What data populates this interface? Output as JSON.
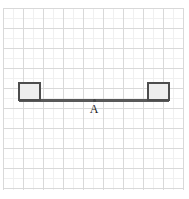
{
  "figure": {
    "width": 189,
    "height": 199,
    "background_color": "#ffffff"
  },
  "grid": {
    "major_color": "#d9d9d9",
    "minor_color": "#f0f0f0",
    "major_spacing": 20,
    "minor_spacing": 10,
    "origin_x": 3,
    "origin_y": 8,
    "extent_x": 183,
    "extent_y": 190,
    "major_x": [
      3,
      23,
      43,
      63,
      83,
      103,
      123,
      143,
      163,
      183
    ],
    "major_y": [
      8,
      28,
      48,
      68,
      88,
      108,
      128,
      148,
      168,
      188
    ],
    "minor_x": [
      13,
      33,
      53,
      73,
      93,
      113,
      133,
      153,
      173
    ],
    "minor_y": [
      18,
      38,
      58,
      78,
      98,
      118,
      138,
      158,
      178
    ]
  },
  "beam": {
    "label": "beam",
    "color": "#595959",
    "x": 19,
    "y": 99,
    "width": 150,
    "height": 3
  },
  "blocks": [
    {
      "label": "left-block",
      "x": 18,
      "y": 82,
      "width": 23,
      "height": 19,
      "fill_color": "#eeeeee",
      "border_color": "#4d4d4d"
    },
    {
      "label": "right-block",
      "x": 147,
      "y": 82,
      "width": 23,
      "height": 19,
      "fill_color": "#eeeeee",
      "border_color": "#4d4d4d"
    }
  ],
  "points": [
    {
      "label": "A",
      "x": 94,
      "y": 100,
      "dot_color": "#444444",
      "label_x": 94,
      "label_y": 103
    }
  ]
}
